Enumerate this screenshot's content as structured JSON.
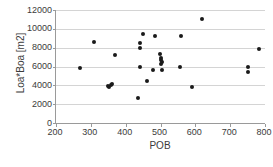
{
  "chart_data": {
    "type": "scatter",
    "title": "",
    "xlabel": "POB",
    "ylabel": "Loa*Boa [m2]",
    "xlim": [
      200,
      800
    ],
    "ylim": [
      0,
      12000
    ],
    "xticks": [
      200,
      300,
      400,
      500,
      600,
      700,
      800
    ],
    "yticks": [
      0,
      2000,
      4000,
      6000,
      8000,
      10000,
      12000
    ],
    "xtick_labels": [
      "200",
      "300",
      "400",
      "500",
      "600",
      "700",
      "800"
    ],
    "ytick_labels": [
      "0",
      "2000",
      "4000",
      "6000",
      "8000",
      "10000",
      "12000"
    ],
    "grid": "horizontal",
    "legend": null,
    "marker": {
      "shape": "circle",
      "color": "#1a1a1a",
      "size": 4
    },
    "axis_color": "#9a9a9a",
    "gridline_color": "#d4d4d4",
    "series": [
      {
        "name": "vessels",
        "points": [
          [
            270,
            5800
          ],
          [
            308,
            8650
          ],
          [
            348,
            3900
          ],
          [
            352,
            3850
          ],
          [
            358,
            4050
          ],
          [
            362,
            4100
          ],
          [
            368,
            7200
          ],
          [
            434,
            2650
          ],
          [
            440,
            8000
          ],
          [
            442,
            8450
          ],
          [
            440,
            6000
          ],
          [
            450,
            9450
          ],
          [
            462,
            4450
          ],
          [
            478,
            5600
          ],
          [
            485,
            9250
          ],
          [
            498,
            7350
          ],
          [
            500,
            6850
          ],
          [
            500,
            6700
          ],
          [
            502,
            6300
          ],
          [
            505,
            6450
          ],
          [
            505,
            5600
          ],
          [
            555,
            6000
          ],
          [
            560,
            9250
          ],
          [
            590,
            3800
          ],
          [
            620,
            11050
          ],
          [
            750,
            5450
          ],
          [
            752,
            5950
          ],
          [
            782,
            7900
          ]
        ]
      }
    ]
  }
}
